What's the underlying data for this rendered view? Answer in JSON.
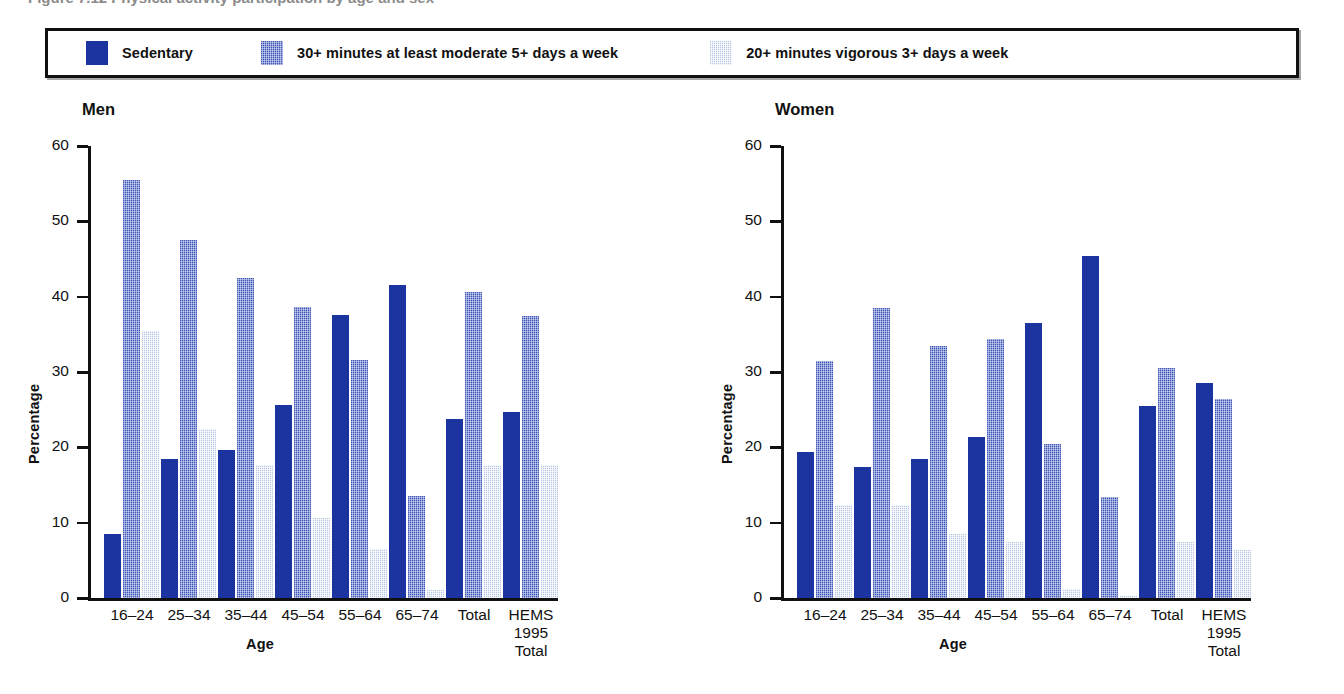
{
  "caption": {
    "text": "Figure 7.12  Physical activity participation by age and sex"
  },
  "legend": {
    "entries": [
      {
        "label": "Sedentary",
        "swatch": "legend-swatch-sedentary",
        "color": "#1b34a0"
      },
      {
        "label": "30+ minutes at least moderate 5+ days a week",
        "swatch": "legend-swatch-moderate",
        "color": "#6b7fd0"
      },
      {
        "label": "20+ minutes vigorous 3+ days a week",
        "swatch": "legend-swatch-vigorous",
        "color": "#dfe6f5"
      }
    ]
  },
  "panels": [
    {
      "title": "Men",
      "ylabel": "Percentage",
      "xlabel": "Age"
    },
    {
      "title": "Women",
      "ylabel": "Percentage",
      "xlabel": "Age"
    }
  ],
  "axis": {
    "ticks": [
      "60",
      "50",
      "40",
      "30",
      "20",
      "10",
      "0"
    ]
  },
  "chart_data": [
    {
      "type": "bar",
      "title": "Men",
      "xlabel": "Age",
      "ylabel": "Percentage",
      "ylim": [
        0,
        60
      ],
      "yticks": [
        0,
        10,
        20,
        30,
        40,
        50,
        60
      ],
      "grid": false,
      "legend_position": "top",
      "categories": [
        "16–24",
        "25–34",
        "35–44",
        "45–54",
        "55–64",
        "65–74",
        "Total",
        "HEMS\n1995\nTotal"
      ],
      "series": [
        {
          "name": "Sedentary",
          "color": "#1b34a0",
          "values": [
            8.5,
            18.5,
            19.6,
            25.6,
            37.6,
            41.6,
            23.7,
            24.7
          ]
        },
        {
          "name": "30+ minutes at least moderate 5+ days a week",
          "color": "#6b7fd0",
          "values": [
            55.5,
            47.5,
            42.5,
            38.6,
            31.6,
            13.6,
            40.6,
            37.5
          ]
        },
        {
          "name": "20+ minutes vigorous 3+ days a week",
          "color": "#dfe6f5",
          "values": [
            35.5,
            22.5,
            17.6,
            10.6,
            6.5,
            1.0,
            17.6,
            17.6
          ]
        }
      ]
    },
    {
      "type": "bar",
      "title": "Women",
      "xlabel": "Age",
      "ylabel": "Percentage",
      "ylim": [
        0,
        60
      ],
      "yticks": [
        0,
        10,
        20,
        30,
        40,
        50,
        60
      ],
      "grid": false,
      "legend_position": "top",
      "categories": [
        "16–24",
        "25–34",
        "35–44",
        "45–54",
        "55–64",
        "65–74",
        "Total",
        "HEMS\n1995\nTotal"
      ],
      "series": [
        {
          "name": "Sedentary",
          "color": "#1b34a0",
          "values": [
            19.4,
            17.4,
            18.4,
            21.4,
            36.5,
            45.4,
            25.5,
            28.5
          ]
        },
        {
          "name": "30+ minutes at least moderate 5+ days a week",
          "color": "#6b7fd0",
          "values": [
            31.5,
            38.5,
            33.4,
            34.4,
            20.5,
            13.4,
            30.5,
            26.4
          ]
        },
        {
          "name": "20+ minutes vigorous 3+ days a week",
          "color": "#dfe6f5",
          "values": [
            12.4,
            12.4,
            8.5,
            7.5,
            1.2,
            0.3,
            7.4,
            6.4
          ]
        }
      ]
    }
  ],
  "categories_display": [
    {
      "line1": "16–24",
      "line2": "",
      "line3": ""
    },
    {
      "line1": "25–34",
      "line2": "",
      "line3": ""
    },
    {
      "line1": "35–44",
      "line2": "",
      "line3": ""
    },
    {
      "line1": "45–54",
      "line2": "",
      "line3": ""
    },
    {
      "line1": "55–64",
      "line2": "",
      "line3": ""
    },
    {
      "line1": "65–74",
      "line2": "",
      "line3": ""
    },
    {
      "line1": "Total",
      "line2": "",
      "line3": ""
    },
    {
      "line1": "HEMS",
      "line2": "1995",
      "line3": "Total"
    }
  ]
}
